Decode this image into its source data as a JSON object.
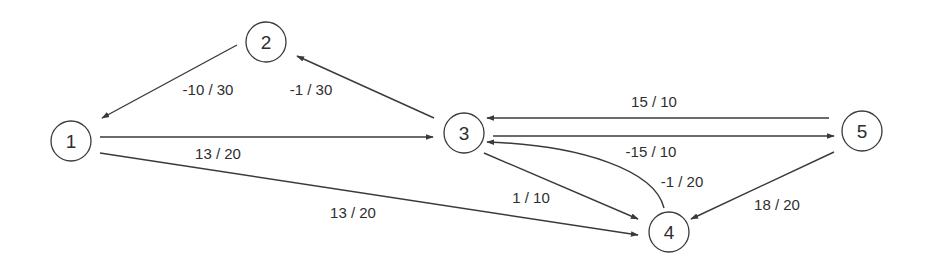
{
  "diagram": {
    "type": "directed-graph",
    "nodes": [
      {
        "id": "1",
        "label": "1",
        "x": 71,
        "y": 141
      },
      {
        "id": "2",
        "label": "2",
        "x": 266,
        "y": 42
      },
      {
        "id": "3",
        "label": "3",
        "x": 464,
        "y": 133
      },
      {
        "id": "4",
        "label": "4",
        "x": 669,
        "y": 232
      },
      {
        "id": "5",
        "label": "5",
        "x": 862,
        "y": 131
      }
    ],
    "edges": [
      {
        "from": "2",
        "to": "1",
        "label": "-10 / 30"
      },
      {
        "from": "3",
        "to": "2",
        "label": "-1 / 30"
      },
      {
        "from": "1",
        "to": "3",
        "label": "13 / 20"
      },
      {
        "from": "1",
        "to": "4",
        "label": "13 / 20"
      },
      {
        "from": "5",
        "to": "3",
        "label": "15 / 10"
      },
      {
        "from": "3",
        "to": "5",
        "label": "-15 / 10"
      },
      {
        "from": "4",
        "to": "3",
        "label": "-1 / 20",
        "curved": true
      },
      {
        "from": "3",
        "to": "4",
        "label": "1 / 10"
      },
      {
        "from": "5",
        "to": "4",
        "label": "18 / 20"
      }
    ]
  },
  "colors": {
    "stroke": "#3a3a3a",
    "text": "#2e2e2e",
    "background": "#ffffff"
  }
}
